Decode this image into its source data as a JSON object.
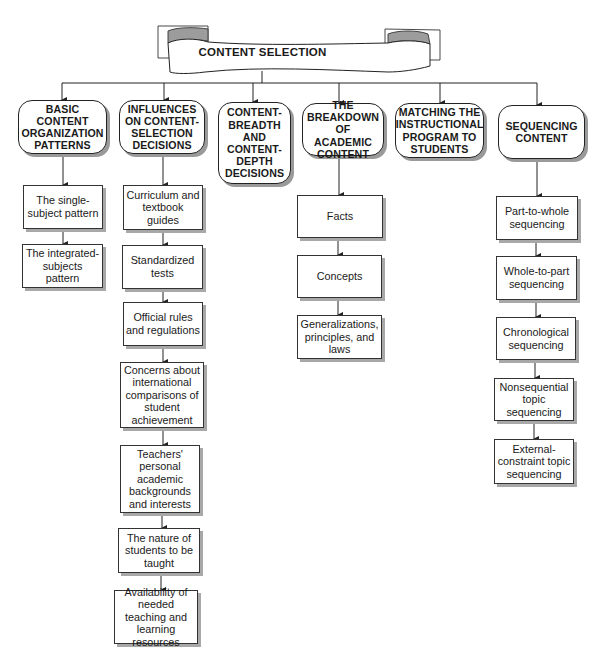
{
  "page": {
    "page_number": "233"
  },
  "banner": {
    "title": "CONTENT SELECTION"
  },
  "columns": [
    {
      "header": "BASIC CONTENT ORGANIZATION PATTERNS",
      "items": [
        "The single-subject pattern",
        "The integrated-subjects pattern"
      ]
    },
    {
      "header": "INFLUENCES ON CONTENT-SELECTION DECISIONS",
      "items": [
        "Curriculum and textbook guides",
        "Standardized tests",
        "Official rules and regulations",
        "Concerns about international comparisons of student achievement",
        "Teachers' personal academic backgrounds and interests",
        "The nature of students to be taught",
        "Availability of needed teaching and learning resources"
      ]
    },
    {
      "header": "CONTENT-BREADTH AND CONTENT-DEPTH DECISIONS",
      "items": []
    },
    {
      "header": "THE BREAKDOWN OF ACADEMIC CONTENT",
      "items": [
        "Facts",
        "Concepts",
        "Generalizations, principles, and laws"
      ]
    },
    {
      "header": "MATCHING THE INSTRUCTIONAL PROGRAM TO STUDENTS",
      "items": []
    },
    {
      "header": "SEQUENCING CONTENT",
      "items": [
        "Part-to-whole sequencing",
        "Whole-to-part sequencing",
        "Chronological sequencing",
        "Nonsequential topic sequencing",
        "External-constraint topic sequencing"
      ]
    }
  ],
  "colors": {
    "line": "#222222",
    "shadow": "#9a9a9a",
    "banner_fold": "#9c9c9c"
  }
}
